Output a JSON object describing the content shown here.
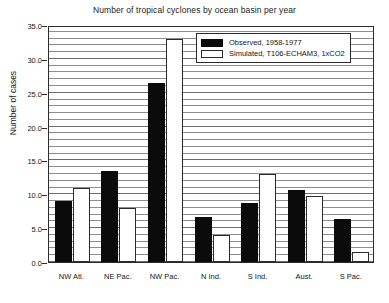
{
  "chart_data": {
    "type": "bar",
    "title": "Number of tropical cyclones by ocean basin per year",
    "xlabel": "",
    "ylabel": "Number of cases",
    "ylim": [
      0.0,
      35.0
    ],
    "ytick_labels": [
      "0.0",
      "5.0",
      "10.0",
      "15.0",
      "20.0",
      "25.0",
      "30.0",
      "35.0"
    ],
    "ytick_values": [
      0,
      5,
      10,
      15,
      20,
      25,
      30,
      35
    ],
    "grid": "horizontal-minor-every-1.0",
    "legend_position": "top-right-inside",
    "categories": [
      "NW Atl.",
      "NE Pac.",
      "NW Pac.",
      "N Ind.",
      "S Ind.",
      "Aust.",
      "S Pac."
    ],
    "series": [
      {
        "name": "Observed, 1958-1977",
        "color": "#0b0b0b",
        "values": [
          9.0,
          13.5,
          26.5,
          6.7,
          8.7,
          10.7,
          6.3
        ]
      },
      {
        "name": "Simulated, T106-ECHAM3, 1xCO2",
        "color": "#ffffff",
        "values": [
          11.0,
          8.0,
          33.0,
          4.0,
          13.0,
          9.7,
          1.5
        ]
      }
    ]
  },
  "legend": {
    "items": [
      {
        "label": "Observed, 1958-1977"
      },
      {
        "label": "Simulated, T106-ECHAM3, 1xCO2"
      }
    ]
  }
}
